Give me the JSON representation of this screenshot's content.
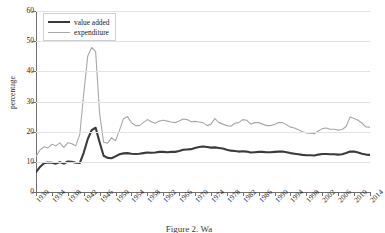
{
  "chart_data": {
    "type": "line",
    "title": "",
    "xlabel": "",
    "ylabel": "percentage",
    "xlim": [
      1930,
      2014
    ],
    "ylim": [
      0,
      60
    ],
    "grid": true,
    "legend_position": "top-left",
    "y_ticks": [
      0,
      10,
      20,
      30,
      40,
      50,
      60
    ],
    "x_ticks": [
      1930,
      1934,
      1938,
      1942,
      1946,
      1950,
      1954,
      1958,
      1962,
      1966,
      1970,
      1974,
      1978,
      1982,
      1986,
      1990,
      1994,
      1998,
      2002,
      2006,
      2010,
      2014
    ],
    "x": [
      1930,
      1931,
      1932,
      1933,
      1934,
      1935,
      1936,
      1937,
      1938,
      1939,
      1940,
      1941,
      1942,
      1943,
      1944,
      1945,
      1946,
      1947,
      1948,
      1949,
      1950,
      1951,
      1952,
      1953,
      1954,
      1955,
      1956,
      1957,
      1958,
      1959,
      1960,
      1961,
      1962,
      1963,
      1964,
      1965,
      1966,
      1967,
      1968,
      1969,
      1970,
      1971,
      1972,
      1973,
      1974,
      1975,
      1976,
      1977,
      1978,
      1979,
      1980,
      1981,
      1982,
      1983,
      1984,
      1985,
      1986,
      1987,
      1988,
      1989,
      1990,
      1991,
      1992,
      1993,
      1994,
      1995,
      1996,
      1997,
      1998,
      1999,
      2000,
      2001,
      2002,
      2003,
      2004,
      2005,
      2006,
      2007,
      2008,
      2009,
      2010,
      2011,
      2012,
      2013,
      2014
    ],
    "series": [
      {
        "name": "value added",
        "color": "#3b3b3b",
        "line_width": 2.1,
        "values": [
          6.6,
          8.3,
          9.5,
          9.8,
          9.7,
          9.4,
          9.9,
          9.4,
          10.1,
          10.0,
          9.7,
          9.6,
          13.0,
          17.5,
          20.5,
          21.3,
          16.5,
          12.0,
          11.3,
          11.2,
          11.8,
          12.5,
          12.8,
          12.9,
          12.7,
          12.6,
          12.7,
          12.9,
          13.1,
          13.0,
          13.1,
          13.3,
          13.3,
          13.2,
          13.3,
          13.3,
          13.6,
          14.0,
          14.1,
          14.2,
          14.6,
          14.9,
          15.1,
          14.9,
          14.7,
          14.8,
          14.6,
          14.4,
          14.0,
          13.7,
          13.6,
          13.4,
          13.5,
          13.4,
          13.1,
          13.2,
          13.3,
          13.3,
          13.2,
          13.2,
          13.3,
          13.4,
          13.4,
          13.2,
          12.9,
          12.7,
          12.5,
          12.3,
          12.2,
          12.2,
          12.1,
          12.4,
          12.6,
          12.6,
          12.5,
          12.5,
          12.4,
          12.5,
          12.9,
          13.4,
          13.4,
          13.1,
          12.7,
          12.4,
          12.3
        ]
      },
      {
        "name": "expenditure",
        "color": "#a8a8a8",
        "line_width": 1.1,
        "values": [
          11.8,
          13.9,
          15.0,
          14.6,
          15.8,
          15.3,
          16.3,
          14.8,
          16.3,
          16.0,
          15.3,
          19.0,
          32.5,
          45.0,
          47.9,
          46.5,
          26.0,
          16.5,
          16.2,
          18.0,
          17.0,
          20.5,
          24.3,
          25.0,
          23.0,
          22.0,
          22.0,
          23.0,
          24.0,
          23.3,
          22.8,
          23.5,
          23.8,
          23.5,
          23.2,
          23.0,
          23.5,
          24.2,
          24.0,
          23.3,
          23.4,
          23.2,
          23.0,
          22.0,
          22.5,
          24.3,
          23.0,
          22.5,
          22.0,
          21.8,
          22.8,
          23.0,
          24.0,
          23.8,
          22.5,
          23.0,
          23.0,
          22.5,
          22.0,
          22.0,
          22.4,
          23.0,
          23.0,
          22.3,
          21.5,
          21.2,
          20.6,
          20.0,
          19.6,
          19.5,
          19.3,
          20.2,
          21.0,
          21.2,
          20.8,
          20.8,
          20.5,
          20.7,
          21.7,
          24.9,
          24.4,
          23.8,
          22.8,
          21.6,
          21.5
        ]
      }
    ],
    "annotations": {
      "wwii_peak_expenditure": 47.9,
      "wwii_peak_value_added": 21.3,
      "wwii_peak_year": 1944
    }
  },
  "legend": {
    "items": [
      {
        "label": "value added"
      },
      {
        "label": "expenditure"
      }
    ]
  },
  "caption": {
    "text": "Figure 2. Wa"
  },
  "colors": {
    "value_added": "#3b3b3b",
    "expenditure": "#a8a8a8",
    "grid": "#e3e3e3",
    "axis": "#6e6e6e"
  }
}
